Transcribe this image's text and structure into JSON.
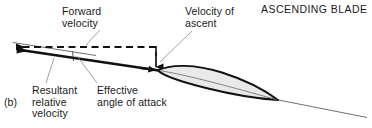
{
  "figure": {
    "panel_label": "(b)",
    "title": "ASCENDING BLADE",
    "width": 372,
    "height": 128,
    "background": "#ffffff"
  },
  "labels": {
    "forward_velocity": "Forward\nvelocity",
    "velocity_of_ascent": "Velocity of\nascent",
    "resultant_relative_velocity": "Resultant\nrelative\nvelocity",
    "effective_angle_of_attack": "Effective\nangle of attack"
  },
  "colors": {
    "line": "#111111",
    "thin_line": "#555555",
    "leader": "#777777",
    "airfoil_fill": "#e9e9e9",
    "airfoil_stroke": "#111111",
    "text": "#1a1a1a"
  },
  "vectors": [
    {
      "name": "forward-velocity-vector",
      "style": "dashed",
      "direction": "left",
      "from": [
        156,
        47
      ],
      "to": [
        12,
        47
      ]
    },
    {
      "name": "velocity-of-ascent-vector",
      "style": "solid",
      "direction": "down",
      "from": [
        156,
        47
      ],
      "to": [
        156,
        67
      ]
    },
    {
      "name": "resultant-relative-velocity-vector",
      "style": "solid-thick",
      "direction": "left",
      "from": [
        157,
        70
      ],
      "to": [
        11,
        49
      ]
    }
  ],
  "airfoil": {
    "name": "airfoil-section",
    "leading_edge": [
      158,
      70
    ],
    "trailing_edge": [
      278,
      100
    ],
    "fill": "#e9e9e9"
  },
  "reference_lines": [
    {
      "name": "chord-extension-forward",
      "from": [
        14,
        43
      ],
      "to": [
        90,
        54
      ]
    },
    {
      "name": "chord-extension-aft",
      "from": [
        278,
        100
      ],
      "to": [
        366,
        117
      ]
    }
  ],
  "angle_marker": {
    "name": "effective-angle-of-attack-marker",
    "at": [
      72,
      52
    ]
  }
}
